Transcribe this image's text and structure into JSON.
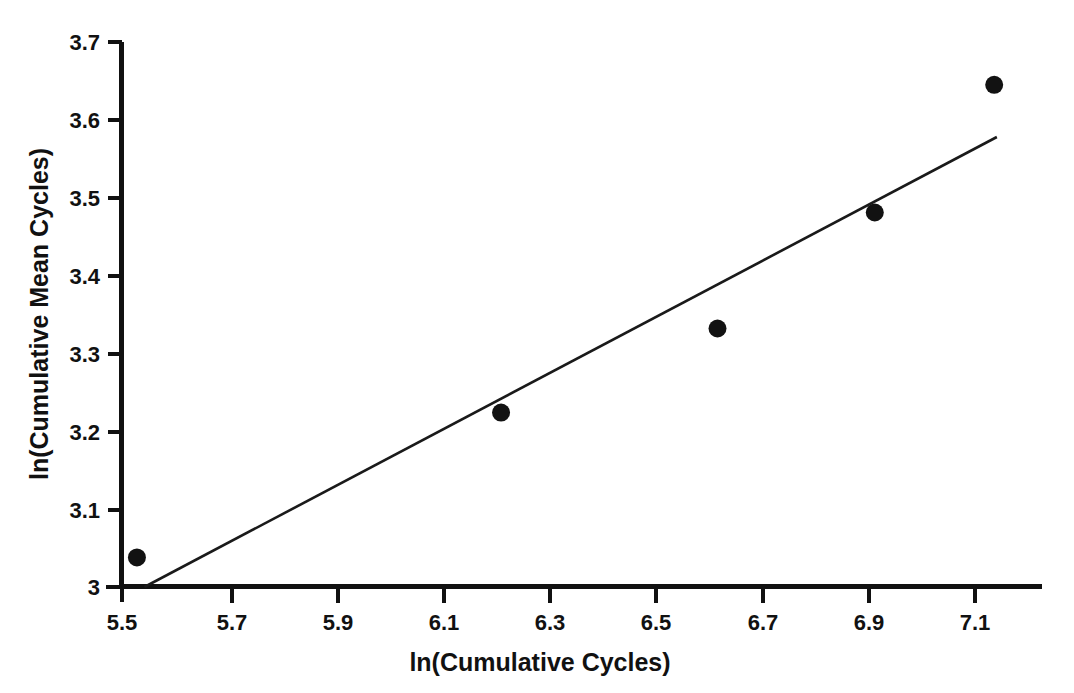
{
  "chart_data": {
    "type": "scatter",
    "title": "",
    "xlabel": "ln(Cumulative Cycles)",
    "ylabel": "ln(Cumulative Mean Cycles)",
    "xlim": [
      5.5,
      7.2
    ],
    "ylim": [
      3.0,
      3.7
    ],
    "grid": false,
    "legend": null,
    "xticks": [
      "5.5",
      "5.7",
      "5.9",
      "6.1",
      "6.3",
      "6.5",
      "6.7",
      "6.9",
      "7.1"
    ],
    "xtick_values": [
      5.5,
      5.7,
      5.9,
      6.1,
      6.3,
      6.5,
      6.7,
      6.9,
      7.1
    ],
    "yticks": [
      "3",
      "3.1",
      "3.2",
      "3.3",
      "3.4",
      "3.5",
      "3.6",
      "3.7"
    ],
    "ytick_values": [
      3.0,
      3.1,
      3.2,
      3.3,
      3.4,
      3.5,
      3.6,
      3.7
    ],
    "series": [
      {
        "name": "observations",
        "marker": "filled-circle",
        "color": "#121212",
        "x": [
          5.528,
          6.211,
          6.617,
          6.912,
          7.136
        ],
        "y": [
          3.038,
          3.224,
          3.332,
          3.481,
          3.645
        ]
      },
      {
        "name": "fitted-trend-line",
        "type": "line",
        "color": "#1a1a1a",
        "x": [
          5.542,
          7.141
        ],
        "y": [
          3.0,
          3.578
        ]
      }
    ],
    "marker_color": "#121212",
    "line_color": "#1a1a1a",
    "background_color": "#ffffff",
    "axis_color": "#111111"
  },
  "axes": {
    "x_title": "ln(Cumulative Cycles)",
    "y_title": "ln(Cumulative Mean Cycles)"
  }
}
